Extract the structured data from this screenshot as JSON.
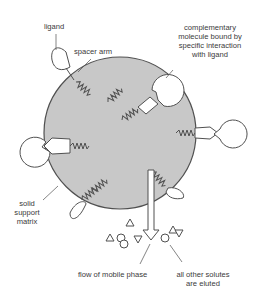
{
  "diagram": {
    "colors": {
      "matrix_fill": "#c8c8c8",
      "stroke": "#505050",
      "text": "#3a3a3a",
      "background": "#ffffff"
    },
    "labels": {
      "ligand": "ligand",
      "spacer_arm": "spacer arm",
      "complementary_1": "complementary",
      "complementary_2": "molecule bound by",
      "complementary_3": "specific interaction",
      "complementary_4": "with ligand",
      "solid_1": "solid",
      "solid_2": "support",
      "solid_3": "matrix",
      "flow": "flow of mobile phase",
      "eluted_1": "all other solutes",
      "eluted_2": "are eluted"
    },
    "elements": {
      "matrix": "solid-support-matrix-sphere",
      "ligands_count": 7,
      "bound_complements_count": 3,
      "solutes": [
        "triangle",
        "circle",
        "circle",
        "triangle-down",
        "triangle",
        "circle",
        "triangle",
        "triangle-down"
      ]
    }
  }
}
